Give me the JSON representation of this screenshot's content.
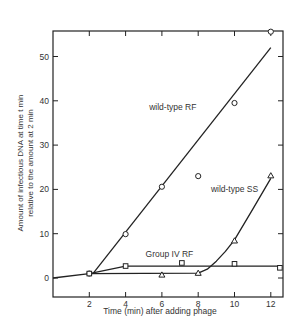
{
  "chart_data": {
    "type": "line",
    "title": "",
    "xlabel": "Time (min) after adding phage",
    "ylabel_line1": "Amount of infectious DNA at time  t  min",
    "ylabel_line2": "relative to the amount at 2 min",
    "xlim": [
      0,
      12.8
    ],
    "ylim": [
      -1.5,
      59
    ],
    "xticks": [
      2,
      4,
      6,
      8,
      10,
      12
    ],
    "yticks": [
      0,
      10,
      20,
      30,
      40,
      50
    ],
    "grid": false,
    "series": [
      {
        "name": "wild-type RF",
        "marker": "circle",
        "points": [
          [
            2,
            1.0
          ],
          [
            4,
            9.9
          ],
          [
            6,
            20.6
          ],
          [
            8,
            23.0
          ],
          [
            10,
            39.5
          ],
          [
            12,
            55.6
          ]
        ],
        "fit_line": [
          [
            2.2,
            1.0
          ],
          [
            12,
            52.0
          ]
        ],
        "label_pos": [
          5.3,
          38
        ]
      },
      {
        "name": "wild-type SS",
        "marker": "triangle",
        "points": [
          [
            6,
            0.7
          ],
          [
            8,
            1.1
          ],
          [
            10,
            8.4
          ],
          [
            12,
            23.1
          ]
        ],
        "curve": [
          [
            2,
            1.0
          ],
          [
            8,
            1.1
          ],
          [
            8.5,
            2.0
          ],
          [
            9,
            3.8
          ],
          [
            9.5,
            6.0
          ],
          [
            10,
            8.6
          ],
          [
            11,
            15.5
          ],
          [
            12,
            22.5
          ]
        ],
        "label_pos": [
          8.7,
          19.5
        ]
      },
      {
        "name": "Group IV RF",
        "marker": "square",
        "points": [
          [
            2,
            1.0
          ],
          [
            4,
            2.7
          ],
          [
            7.1,
            3.4
          ],
          [
            10,
            3.2
          ],
          [
            12.5,
            2.3
          ]
        ],
        "curve": [
          [
            0,
            0
          ],
          [
            2,
            1.0
          ],
          [
            4,
            2.7
          ],
          [
            12.5,
            2.7
          ]
        ],
        "label_pos": [
          5.1,
          4.8
        ]
      }
    ]
  }
}
